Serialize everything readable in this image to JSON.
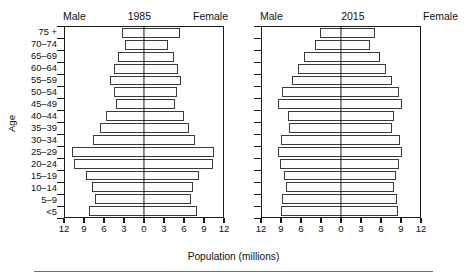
{
  "figure": {
    "age_axis_title": "Age",
    "x_axis_title": "Population (millions)"
  },
  "panels": [
    {
      "id": "1985",
      "male_label": "Male",
      "year": "1985",
      "female_label": "Female"
    },
    {
      "id": "2015",
      "male_label": "Male",
      "year": "2015",
      "female_label": "Female"
    }
  ],
  "axes": {
    "age_groups": [
      "75 +",
      "70–74",
      "65–69",
      "60–64",
      "55–59",
      "50–54",
      "45–49",
      "40–44",
      "35–39",
      "30–34",
      "25–29",
      "20–24",
      "15–19",
      "10–14",
      "5–9",
      "<5"
    ],
    "x_tick_labels": [
      "12",
      "9",
      "6",
      "3",
      "0",
      "3",
      "6",
      "9",
      "12"
    ],
    "x_tick_values": [
      -12,
      -9,
      -6,
      -3,
      0,
      3,
      6,
      9,
      12
    ],
    "x_max": 12,
    "x_min": -12
  },
  "chart_data": {
    "type": "bar",
    "subtype": "population-pyramid",
    "xlabel": "Population (millions)",
    "ylabel": "Age",
    "xlim": [
      -12,
      12
    ],
    "grid": false,
    "legend": [
      "Male",
      "Female"
    ],
    "legend_position": "top",
    "categories": [
      "75 +",
      "70–74",
      "65–69",
      "60–64",
      "55–59",
      "50–54",
      "45–49",
      "40–44",
      "35–39",
      "30–34",
      "25–29",
      "20–24",
      "15–19",
      "10–14",
      "5–9",
      "<5"
    ],
    "panels": [
      {
        "name": "1985",
        "series": [
          {
            "name": "Male",
            "values": [
              3.3,
              2.9,
              3.9,
              4.6,
              5.2,
              4.5,
              4.3,
              5.8,
              6.7,
              7.8,
              10.9,
              10.7,
              8.8,
              7.9,
              7.5,
              8.4
            ]
          },
          {
            "name": "Female",
            "values": [
              5.5,
              3.7,
              4.6,
              5.1,
              5.6,
              5.0,
              4.7,
              6.1,
              6.9,
              7.8,
              10.7,
              10.5,
              8.4,
              7.5,
              7.1,
              8.1
            ]
          }
        ]
      },
      {
        "name": "2015",
        "series": [
          {
            "name": "Male",
            "values": [
              3.2,
              3.9,
              5.6,
              6.5,
              7.5,
              8.9,
              9.6,
              8.1,
              7.9,
              9.1,
              9.6,
              9.2,
              8.7,
              8.4,
              8.9,
              9.1
            ]
          },
          {
            "name": "Female",
            "values": [
              5.1,
              4.4,
              5.9,
              6.8,
              7.7,
              8.8,
              9.3,
              8.0,
              7.8,
              8.9,
              9.2,
              8.8,
              8.3,
              8.0,
              8.5,
              8.7
            ]
          }
        ]
      }
    ]
  }
}
